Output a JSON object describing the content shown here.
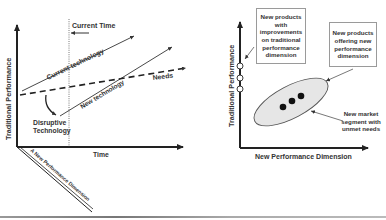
{
  "left_diagram": {
    "y_axis_label": "Traditional Performance",
    "x_axis_label": "Time",
    "diagonal_axis_label": "A New Performance Dimension",
    "current_time_label": "Current Time",
    "current_technology_label": "Current technology",
    "new_technology_label": "New technology",
    "needs_label": "Needs",
    "disruptive_label_line1": "Disruptive",
    "disruptive_label_line2": "Technology"
  },
  "right_diagram": {
    "y_axis_label": "Traditional Performance",
    "x_axis_label": "New Performance Dimension",
    "callout_traditional": "New products with improvements on traditional performance dimension",
    "callout_new_dimension": "New products offering new performance dimension",
    "callout_market_segment": "New market segment with unmet needs",
    "open_circle_count": 3,
    "filled_dot_count": 3
  },
  "colors": {
    "line": "#333333",
    "ellipse_fill": "#e6e6e6",
    "box_border": "#9a9a9a"
  }
}
